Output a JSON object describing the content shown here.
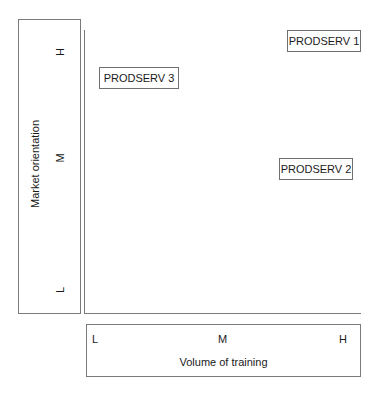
{
  "y_axis": {
    "title": "Market orientation",
    "ticks": [
      "H",
      "M",
      "L"
    ]
  },
  "x_axis": {
    "title": "Volume of training",
    "ticks": [
      "L",
      "M",
      "H"
    ]
  },
  "nodes": [
    {
      "label": "PRODSERV 1",
      "x_level": "H",
      "y_level": "H"
    },
    {
      "label": "PRODSERV 3",
      "x_level": "L",
      "y_level": "H"
    },
    {
      "label": "PRODSERV 2",
      "x_level": "H",
      "y_level": "M"
    }
  ],
  "colors": {
    "border": "#7a7a7a",
    "text": "#1a1a1a",
    "background": "#ffffff"
  }
}
